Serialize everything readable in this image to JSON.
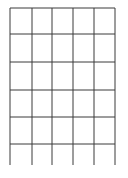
{
  "grid": {
    "line_color": "#3a3a3a",
    "columns": 5,
    "rows": 6,
    "vertical_x": [
      10,
      32,
      52,
      73,
      94,
      115
    ],
    "horizontal_y": [
      8,
      34,
      62,
      90,
      117,
      144
    ],
    "top": 8,
    "bottom": 165,
    "left": 10,
    "right": 115
  }
}
